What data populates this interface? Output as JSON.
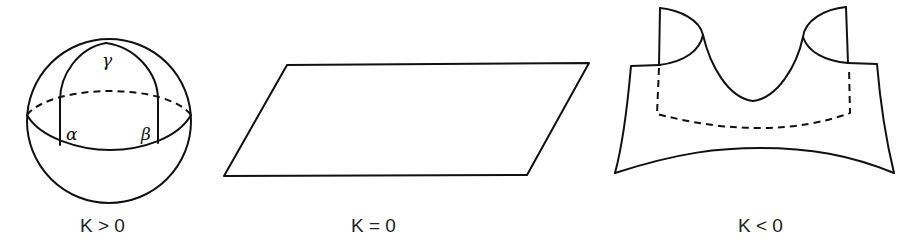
{
  "figure": {
    "panels": [
      {
        "id": "positive",
        "shape": "sphere",
        "caption": "K > 0",
        "angle_labels": {
          "top": "γ",
          "left": "α",
          "right": "β"
        }
      },
      {
        "id": "zero",
        "shape": "plane",
        "caption": "K = 0"
      },
      {
        "id": "negative",
        "shape": "saddle",
        "caption": "K < 0"
      }
    ],
    "colors": {
      "line": "#111111",
      "text": "#222222",
      "background": "#ffffff"
    }
  }
}
